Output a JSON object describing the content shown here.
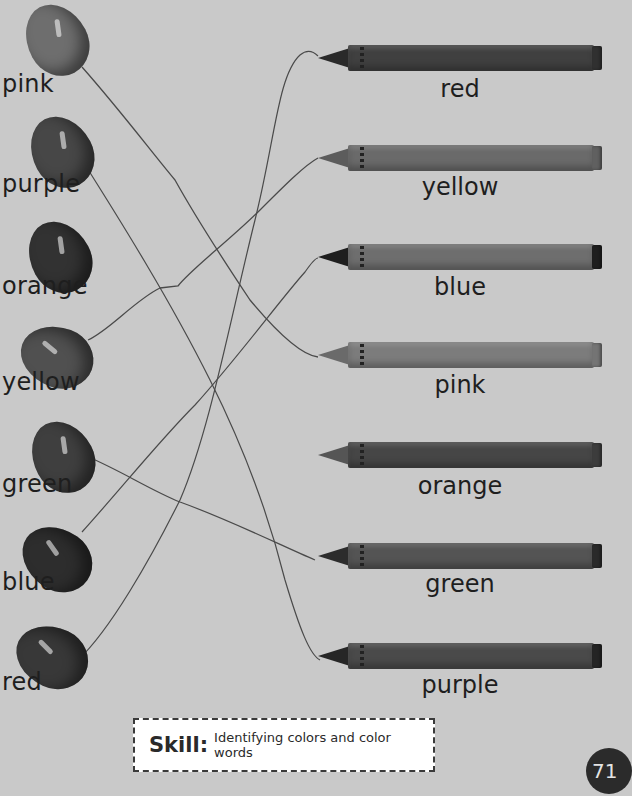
{
  "jellybeans": [
    {
      "label": "pink",
      "color": "#6e6e6e",
      "left": 27,
      "top": 3,
      "label_top": 70
    },
    {
      "label": "purple",
      "color": "#474747",
      "left": 32,
      "top": 115,
      "label_top": 170
    },
    {
      "label": "orange",
      "color": "#323232",
      "left": 30,
      "top": 220,
      "label_top": 272
    },
    {
      "label": "yellow",
      "color": "#505050",
      "left": 27,
      "top": 320,
      "label_top": 368
    },
    {
      "label": "green",
      "color": "#3f3f3f",
      "left": 33,
      "top": 420,
      "label_top": 470
    },
    {
      "label": "blue",
      "color": "#2d2d2d",
      "left": 27,
      "top": 522,
      "label_top": 568
    },
    {
      "label": "red",
      "color": "#383838",
      "left": 22,
      "top": 620,
      "label_top": 668
    }
  ],
  "crayons": [
    {
      "label": "red",
      "color": "#404040",
      "tip": "#2a2a2a",
      "top": 45,
      "label_top": 75
    },
    {
      "label": "yellow",
      "color": "#6a6a6a",
      "tip": "#5c5c5c",
      "top": 145,
      "label_top": 173
    },
    {
      "label": "blue",
      "color": "#6e6e6e",
      "tip": "#1e1e1e",
      "top": 244,
      "label_top": 273
    },
    {
      "label": "pink",
      "color": "#7c7c7c",
      "tip": "#6a6a6a",
      "top": 342,
      "label_top": 371
    },
    {
      "label": "orange",
      "color": "#464646",
      "tip": "#555555",
      "top": 442,
      "label_top": 472
    },
    {
      "label": "green",
      "color": "#545454",
      "tip": "#2c2c2c",
      "top": 543,
      "label_top": 570
    },
    {
      "label": "purple",
      "color": "#4a4a4a",
      "tip": "#262626",
      "top": 643,
      "label_top": 671
    }
  ],
  "connections": [
    {
      "from": "pink",
      "to": "pink"
    },
    {
      "from": "purple",
      "to": "purple"
    },
    {
      "from": "yellow",
      "to": "yellow"
    },
    {
      "from": "green",
      "to": "green"
    },
    {
      "from": "blue",
      "to": "blue"
    },
    {
      "from": "red",
      "to": "red"
    }
  ],
  "line_color": "#4a4a4a",
  "skill": {
    "title": "Skill:",
    "text": "Identifying colors and color words"
  },
  "page_number": "71"
}
